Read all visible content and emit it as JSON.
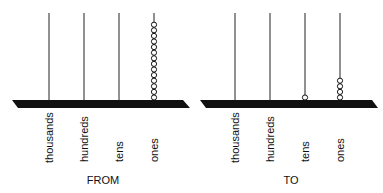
{
  "panels": [
    {
      "id": "from",
      "caption": "FROM",
      "columns": [
        {
          "label": "thousands",
          "beads": 0
        },
        {
          "label": "hundreds",
          "beads": 0
        },
        {
          "label": "tens",
          "beads": 0
        },
        {
          "label": "ones",
          "beads": 14
        }
      ]
    },
    {
      "id": "to",
      "caption": "TO",
      "columns": [
        {
          "label": "thousands",
          "beads": 0
        },
        {
          "label": "hundreds",
          "beads": 0
        },
        {
          "label": "tens",
          "beads": 1
        },
        {
          "label": "ones",
          "beads": 4
        }
      ]
    }
  ],
  "colors": {
    "ink": "#111111",
    "background": "#ffffff"
  }
}
